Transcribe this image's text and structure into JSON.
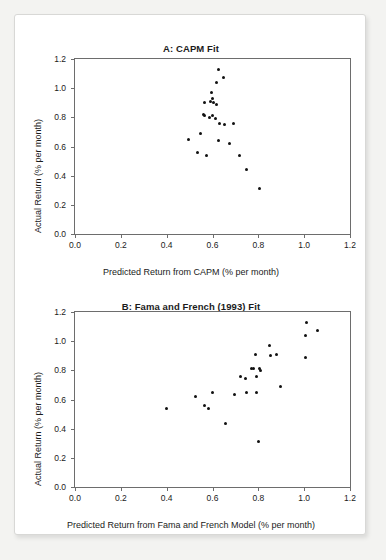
{
  "figure": {
    "background_color": "#f3f3f1",
    "card_color": "#ffffff",
    "point_color": "#111111",
    "axis_color": "#6d6d6d"
  },
  "chart_data": [
    {
      "type": "scatter",
      "panel": "A",
      "title": "A: CAPM Fit",
      "xlabel": "Predicted Return from CAPM (% per month)",
      "ylabel": "Actual Return (% per month)",
      "xlim": [
        0.0,
        1.2
      ],
      "ylim": [
        0.0,
        1.2
      ],
      "xticks": [
        "0.0",
        "0.2",
        "0.4",
        "0.6",
        "0.8",
        "1.0",
        "1.2"
      ],
      "yticks": [
        "0.0",
        "0.2",
        "0.4",
        "0.6",
        "0.8",
        "1.0",
        "1.2"
      ],
      "xtick_values": [
        0.0,
        0.2,
        0.4,
        0.6,
        0.8,
        1.0,
        1.2
      ],
      "ytick_values": [
        0.0,
        0.2,
        0.4,
        0.6,
        0.8,
        1.0,
        1.2
      ],
      "grid": false,
      "legend": null,
      "points": [
        [
          0.625,
          1.13
        ],
        [
          0.65,
          1.07
        ],
        [
          0.617,
          1.04
        ],
        [
          0.597,
          0.97
        ],
        [
          0.602,
          0.93
        ],
        [
          0.567,
          0.9
        ],
        [
          0.592,
          0.91
        ],
        [
          0.605,
          0.9
        ],
        [
          0.617,
          0.89
        ],
        [
          0.56,
          0.82
        ],
        [
          0.566,
          0.81
        ],
        [
          0.586,
          0.8
        ],
        [
          0.598,
          0.81
        ],
        [
          0.613,
          0.79
        ],
        [
          0.632,
          0.76
        ],
        [
          0.652,
          0.75
        ],
        [
          0.693,
          0.76
        ],
        [
          0.546,
          0.69
        ],
        [
          0.497,
          0.645
        ],
        [
          0.628,
          0.64
        ],
        [
          0.676,
          0.62
        ],
        [
          0.536,
          0.56
        ],
        [
          0.572,
          0.535
        ],
        [
          0.717,
          0.535
        ],
        [
          0.748,
          0.44
        ],
        [
          0.806,
          0.31
        ]
      ]
    },
    {
      "type": "scatter",
      "panel": "B",
      "title": "B: Fama and French (1993) Fit",
      "xlabel": "Predicted Return from Fama and French Model (% per month)",
      "ylabel": "Actual Return (% per month)",
      "xlim": [
        0.0,
        1.2
      ],
      "ylim": [
        0.0,
        1.2
      ],
      "xticks": [
        "0.0",
        "0.2",
        "0.4",
        "0.6",
        "0.8",
        "1.0",
        "1.2"
      ],
      "yticks": [
        "0.0",
        "0.2",
        "0.4",
        "0.6",
        "0.8",
        "1.0",
        "1.2"
      ],
      "xtick_values": [
        0.0,
        0.2,
        0.4,
        0.6,
        0.8,
        1.0,
        1.2
      ],
      "ytick_values": [
        0.0,
        0.2,
        0.4,
        0.6,
        0.8,
        1.0,
        1.2
      ],
      "grid": false,
      "legend": null,
      "points": [
        [
          1.01,
          1.13
        ],
        [
          1.06,
          1.07
        ],
        [
          1.007,
          1.04
        ],
        [
          0.848,
          0.97
        ],
        [
          0.789,
          0.91
        ],
        [
          0.855,
          0.9
        ],
        [
          0.879,
          0.91
        ],
        [
          1.005,
          0.89
        ],
        [
          0.77,
          0.815
        ],
        [
          0.777,
          0.815
        ],
        [
          0.806,
          0.81
        ],
        [
          0.808,
          0.8
        ],
        [
          0.723,
          0.76
        ],
        [
          0.742,
          0.745
        ],
        [
          0.79,
          0.755
        ],
        [
          0.898,
          0.69
        ],
        [
          0.601,
          0.645
        ],
        [
          0.695,
          0.635
        ],
        [
          0.748,
          0.645
        ],
        [
          0.79,
          0.645
        ],
        [
          0.526,
          0.62
        ],
        [
          0.566,
          0.56
        ],
        [
          0.583,
          0.535
        ],
        [
          0.399,
          0.535
        ],
        [
          0.657,
          0.435
        ],
        [
          0.8,
          0.31
        ]
      ]
    }
  ]
}
